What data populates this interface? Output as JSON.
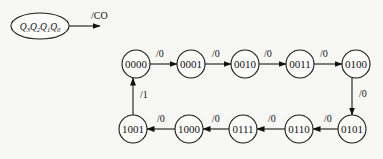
{
  "legend": {
    "state_label": "Q3Q2Q1Q0",
    "state_label_parts": [
      "Q",
      "3",
      "Q",
      "2",
      "Q",
      "1",
      "Q",
      "0"
    ],
    "output_label": "/CO"
  },
  "states": [
    {
      "id": "s0",
      "label": "0000",
      "cx": 136,
      "cy": 64
    },
    {
      "id": "s1",
      "label": "0001",
      "cx": 191,
      "cy": 64
    },
    {
      "id": "s2",
      "label": "0010",
      "cx": 245,
      "cy": 64
    },
    {
      "id": "s3",
      "label": "0011",
      "cx": 300,
      "cy": 64
    },
    {
      "id": "s4",
      "label": "0100",
      "cx": 356,
      "cy": 64
    },
    {
      "id": "s5",
      "label": "0101",
      "cx": 352,
      "cy": 129
    },
    {
      "id": "s6",
      "label": "0110",
      "cx": 299,
      "cy": 129
    },
    {
      "id": "s7",
      "label": "0111",
      "cx": 243,
      "cy": 129
    },
    {
      "id": "s8",
      "label": "1000",
      "cx": 189,
      "cy": 129
    },
    {
      "id": "s9",
      "label": "1001",
      "cx": 133,
      "cy": 129
    }
  ],
  "transitions": [
    {
      "from": "0000",
      "to": "0001",
      "label": "/0"
    },
    {
      "from": "0001",
      "to": "0010",
      "label": "/0"
    },
    {
      "from": "0010",
      "to": "0011",
      "label": "/0"
    },
    {
      "from": "0011",
      "to": "0100",
      "label": "/0"
    },
    {
      "from": "0100",
      "to": "0101",
      "label": "/0"
    },
    {
      "from": "0101",
      "to": "0110",
      "label": "/0"
    },
    {
      "from": "0110",
      "to": "0111",
      "label": "/0"
    },
    {
      "from": "0111",
      "to": "1000",
      "label": "/0"
    },
    {
      "from": "1000",
      "to": "1001",
      "label": "/0"
    },
    {
      "from": "1001",
      "to": "0000",
      "label": "/1"
    }
  ]
}
